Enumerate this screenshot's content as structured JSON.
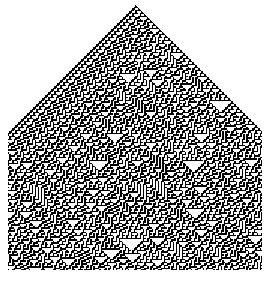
{
  "figure": {
    "title": "",
    "kind": "cellular-automaton-silhouette",
    "background_color": "#ffffff",
    "cell_on_color": "#000000",
    "cell_off_color": "#ffffff",
    "canvas_width": 271,
    "canvas_height": 281
  },
  "automaton": {
    "rule_number": 30,
    "rule_binary": "00011110",
    "neighborhood": 3,
    "states": 2,
    "initial_condition": "single-center-cell",
    "boundary": "wrap",
    "columns": 180,
    "rows": 178,
    "cell_size_px": 1.5,
    "seed": 30303
  },
  "silhouette": {
    "shape_name": "pentagon-house",
    "description": "house outline: rectangular body with triangular gable roof",
    "apex": {
      "x": 135,
      "y": 5
    },
    "left_shoulder": {
      "x": 8,
      "y": 128
    },
    "right_shoulder": {
      "x": 262,
      "y": 128
    },
    "bottom_left": {
      "x": 8,
      "y": 270
    },
    "bottom_right": {
      "x": 262,
      "y": 270
    },
    "roof_angle_deg": 45
  },
  "chart_data": {
    "type": "heatmap",
    "xlabel": "cell index",
    "ylabel": "generation",
    "grid": false,
    "legend": "none",
    "series": [
      {
        "name": "Rule 30",
        "rule": 30,
        "values": [
          0,
          1
        ]
      }
    ]
  }
}
